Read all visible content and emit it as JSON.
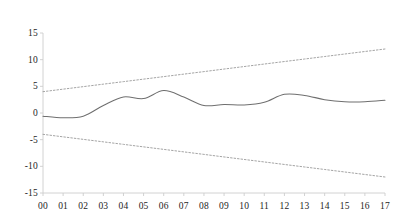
{
  "chart_data": {
    "type": "line",
    "title": "",
    "subtitle": "",
    "xlabel": "",
    "ylabel": "",
    "grid": false,
    "legend": "none",
    "categories": [
      "00",
      "01",
      "02",
      "03",
      "04",
      "05",
      "06",
      "07",
      "08",
      "09",
      "10",
      "11",
      "12",
      "13",
      "14",
      "15",
      "16",
      "17"
    ],
    "x": [
      0,
      1,
      2,
      3,
      4,
      5,
      6,
      7,
      8,
      9,
      10,
      11,
      12,
      13,
      14,
      15,
      16,
      17
    ],
    "yticks": [
      15,
      10,
      5,
      0,
      -5,
      -10,
      -15
    ],
    "ytick_labels": [
      "15",
      "10",
      "5",
      "0",
      "-5",
      "-10",
      "-15"
    ],
    "ylim": [
      -15,
      15
    ],
    "xlim": [
      0,
      17
    ],
    "series": [
      {
        "name": "value",
        "style": "solid",
        "color": "#6f6f6f",
        "values": [
          -0.6,
          -0.9,
          -0.6,
          1.4,
          3.0,
          2.7,
          4.2,
          3.0,
          1.4,
          1.6,
          1.5,
          2.0,
          3.5,
          3.3,
          2.5,
          2.1,
          2.1,
          2.4
        ]
      },
      {
        "name": "upper-bound",
        "style": "dotted",
        "color": "#9a9a9a",
        "values": [
          4.0,
          4.47,
          4.94,
          5.41,
          5.88,
          6.35,
          6.82,
          7.29,
          7.76,
          8.24,
          8.71,
          9.18,
          9.65,
          10.12,
          10.59,
          11.06,
          11.53,
          12.0
        ]
      },
      {
        "name": "lower-bound",
        "style": "dotted",
        "color": "#9a9a9a",
        "values": [
          -4.0,
          -4.47,
          -4.94,
          -5.41,
          -5.88,
          -6.35,
          -6.82,
          -7.29,
          -7.76,
          -8.24,
          -8.71,
          -9.18,
          -9.65,
          -10.12,
          -10.59,
          -11.06,
          -11.53,
          -12.0
        ]
      }
    ],
    "colors": {
      "axis": "#cfcfcf",
      "series_line": "#6f6f6f",
      "bounds_line": "#9a9a9a",
      "text": "#1d1d1d",
      "background": "#ffffff"
    }
  }
}
